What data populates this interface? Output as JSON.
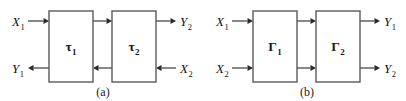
{
  "figure": {
    "colors": {
      "background": "#ffffff",
      "box_stroke": "#5a5a5a",
      "box_fill": "#ffffff",
      "wire": "#3a3a3a",
      "arrowhead": "#2a2a2a",
      "text": "#1a1a1a"
    },
    "panels": [
      {
        "id": "a",
        "caption": "(a)",
        "caption_x": 103,
        "caption_y": 96,
        "blocks": [
          {
            "name": "tau-1",
            "symbol": "τ",
            "subscript": "1",
            "x": 49,
            "y": 11,
            "width": 44,
            "height": 71,
            "label_x": 71,
            "label_y": 51
          },
          {
            "name": "tau-2",
            "symbol": "τ",
            "subscript": "2",
            "x": 112,
            "y": 11,
            "width": 44,
            "height": 71,
            "label_x": 134,
            "label_y": 51
          }
        ],
        "ports": [
          {
            "name": "input-x1",
            "symbol": "X",
            "subscript": "1",
            "label_x": 12,
            "label_y": 26,
            "direction": "right",
            "line_x1": 28,
            "line_x2": 49,
            "line_y": 21
          },
          {
            "name": "output-y1",
            "symbol": "Y",
            "subscript": "1",
            "label_x": 12,
            "label_y": 73,
            "direction": "left",
            "line_x1": 49,
            "line_x2": 28,
            "line_y": 68
          },
          {
            "name": "output-y2",
            "symbol": "Y",
            "subscript": "2",
            "label_x": 180,
            "label_y": 26,
            "direction": "right",
            "line_x1": 156,
            "line_x2": 176,
            "line_y": 21
          },
          {
            "name": "input-x2",
            "symbol": "X",
            "subscript": "2",
            "label_x": 180,
            "label_y": 73,
            "direction": "left",
            "line_x1": 176,
            "line_x2": 156,
            "line_y": 68
          }
        ],
        "links": [
          {
            "name": "link-tau1-to-tau2-top",
            "direction": "right",
            "line_x1": 93,
            "line_x2": 112,
            "line_y": 21
          },
          {
            "name": "link-tau2-to-tau1-bottom",
            "direction": "left",
            "line_x1": 112,
            "line_x2": 93,
            "line_y": 68
          }
        ]
      },
      {
        "id": "b",
        "caption": "(b)",
        "caption_x": 307,
        "caption_y": 96,
        "blocks": [
          {
            "name": "gamma-1",
            "symbol": "Γ",
            "subscript": "1",
            "x": 253,
            "y": 11,
            "width": 44,
            "height": 71,
            "label_x": 275,
            "label_y": 51
          },
          {
            "name": "gamma-2",
            "symbol": "Γ",
            "subscript": "2",
            "x": 316,
            "y": 11,
            "width": 44,
            "height": 71,
            "label_x": 338,
            "label_y": 51
          }
        ],
        "ports": [
          {
            "name": "input-x1",
            "symbol": "X",
            "subscript": "1",
            "label_x": 216,
            "label_y": 26,
            "direction": "right",
            "line_x1": 232,
            "line_x2": 253,
            "line_y": 21
          },
          {
            "name": "input-x2",
            "symbol": "X",
            "subscript": "2",
            "label_x": 216,
            "label_y": 73,
            "direction": "right",
            "line_x1": 232,
            "line_x2": 253,
            "line_y": 68
          },
          {
            "name": "output-y1",
            "symbol": "Y",
            "subscript": "1",
            "label_x": 384,
            "label_y": 26,
            "direction": "right",
            "line_x1": 360,
            "line_x2": 380,
            "line_y": 21
          },
          {
            "name": "output-y2",
            "symbol": "Y",
            "subscript": "2",
            "label_x": 384,
            "label_y": 73,
            "direction": "right",
            "line_x1": 360,
            "line_x2": 380,
            "line_y": 68
          }
        ],
        "links": [
          {
            "name": "link-gamma1-to-gamma2-top",
            "direction": "right",
            "line_x1": 297,
            "line_x2": 316,
            "line_y": 21
          },
          {
            "name": "link-gamma1-to-gamma2-bottom",
            "direction": "right",
            "line_x1": 297,
            "line_x2": 316,
            "line_y": 68
          }
        ]
      }
    ]
  }
}
